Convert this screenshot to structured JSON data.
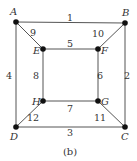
{
  "caption": "(b)",
  "colors": {
    "edge": "#555555",
    "node": "#111111",
    "text": "#333333"
  },
  "nodes": [
    {
      "id": "A",
      "x": 16,
      "y": 22,
      "lx": 10,
      "ly": 15
    },
    {
      "id": "B",
      "x": 125,
      "y": 23,
      "lx": 122,
      "ly": 16
    },
    {
      "id": "C",
      "x": 125,
      "y": 127,
      "lx": 121,
      "ly": 140
    },
    {
      "id": "D",
      "x": 16,
      "y": 127,
      "lx": 10,
      "ly": 140
    },
    {
      "id": "E",
      "x": 43,
      "y": 49,
      "lx": 33,
      "ly": 54
    },
    {
      "id": "F",
      "x": 98,
      "y": 49,
      "lx": 101,
      "ly": 54
    },
    {
      "id": "G",
      "x": 98,
      "y": 101,
      "lx": 101,
      "ly": 105
    },
    {
      "id": "H",
      "x": 43,
      "y": 101,
      "lx": 32,
      "ly": 105
    }
  ],
  "edges": [
    {
      "from": "A",
      "to": "B",
      "label": "1",
      "lx": 70,
      "ly": 21
    },
    {
      "from": "B",
      "to": "C",
      "label": "2",
      "lx": 127,
      "ly": 79
    },
    {
      "from": "D",
      "to": "C",
      "label": "3",
      "lx": 70,
      "ly": 136
    },
    {
      "from": "A",
      "to": "D",
      "label": "4",
      "lx": 9,
      "ly": 79
    },
    {
      "from": "E",
      "to": "F",
      "label": "5",
      "lx": 70,
      "ly": 47
    },
    {
      "from": "F",
      "to": "G",
      "label": "6",
      "lx": 100,
      "ly": 79
    },
    {
      "from": "H",
      "to": "G",
      "label": "7",
      "lx": 70,
      "ly": 112
    },
    {
      "from": "E",
      "to": "H",
      "label": "8",
      "lx": 36,
      "ly": 79
    },
    {
      "from": "A",
      "to": "E",
      "label": "9",
      "lx": 33,
      "ly": 36
    },
    {
      "from": "B",
      "to": "F",
      "label": "10",
      "lx": 98,
      "ly": 37
    },
    {
      "from": "G",
      "to": "C",
      "label": "11",
      "lx": 100,
      "ly": 121
    },
    {
      "from": "H",
      "to": "D",
      "label": "12",
      "lx": 33,
      "ly": 121
    }
  ]
}
